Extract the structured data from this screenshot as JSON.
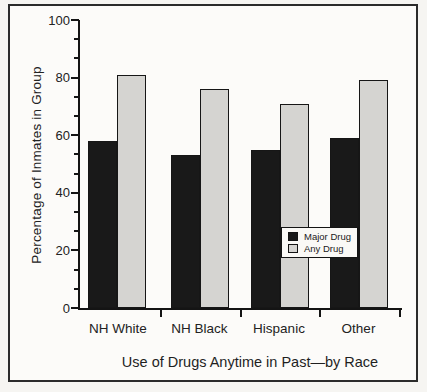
{
  "chart_data": {
    "type": "bar",
    "title": "Use of Drugs Anytime in Past—by Race",
    "xlabel": "Use of Drugs Anytime in Past—by Race",
    "ylabel": "Percentage of Inmates in Group",
    "categories": [
      "NH White",
      "NH Black",
      "Hispanic",
      "Other"
    ],
    "series": [
      {
        "name": "Major Drug",
        "color": "#191919",
        "values": [
          58,
          53,
          55,
          59
        ]
      },
      {
        "name": "Any Drug",
        "color": "#d5d4d1",
        "values": [
          81,
          76,
          71,
          79
        ]
      }
    ],
    "ylim": [
      0,
      100
    ],
    "yticks": [
      0,
      20,
      40,
      60,
      80,
      100
    ],
    "ytick_labels": [
      "0",
      "20",
      "40",
      "60",
      "80",
      "100"
    ],
    "minor_ticks_between_majors": 2,
    "grid": false,
    "legend_position": "center-right",
    "legend_entries": [
      "Major Drug",
      "Any Drug"
    ]
  },
  "colors": {
    "bar_major_drug": "#191919",
    "bar_any_drug": "#d5d4d1",
    "ink": "#141414",
    "paper": "#f6f5f2",
    "plot_background": "#fcfbf9"
  }
}
